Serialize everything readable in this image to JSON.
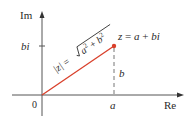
{
  "diagram": {
    "type": "complex-plane",
    "axes": {
      "x_label": "Re",
      "y_label": "Im",
      "origin_label": "0"
    },
    "point": {
      "label": "z = a + bi",
      "label_parts": {
        "z": "z",
        "eq": " = ",
        "a": "a",
        "plus": " + ",
        "bi": "bi"
      },
      "color": "#d9402b"
    },
    "ticks": {
      "x_tick_label": "a",
      "y_tick_label": "bi"
    },
    "vertical_segment_label": "b",
    "modulus_label": {
      "lhs": "|z|",
      "eq": " = ",
      "radicand_a": "a",
      "exp_a": "2",
      "plus": " + ",
      "radicand_b": "b",
      "exp_b": "2"
    },
    "colors": {
      "vector": "#d9402b",
      "axis": "#555555",
      "dashed": "#777777",
      "text": "#2a2a2a"
    }
  }
}
